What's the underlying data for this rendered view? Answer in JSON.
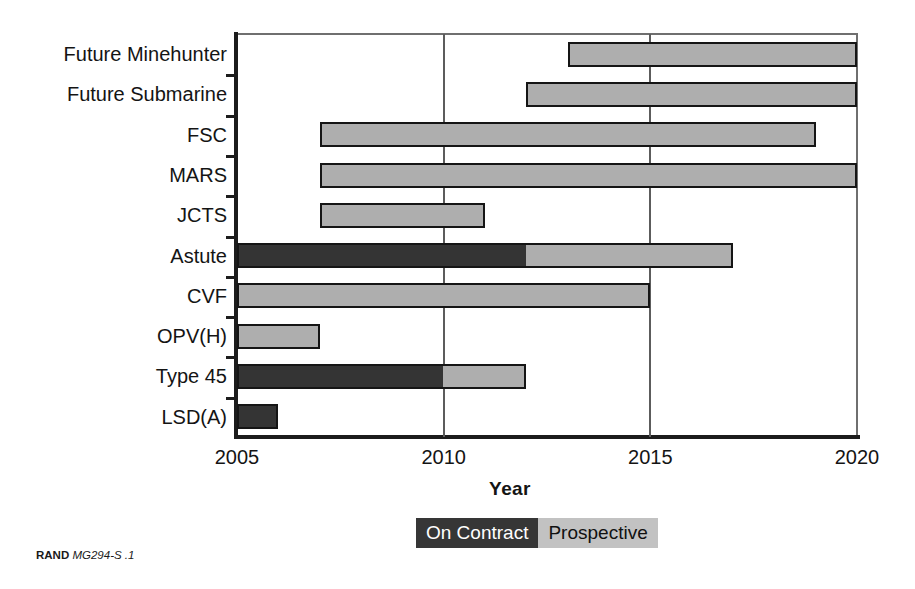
{
  "chart_data": {
    "type": "bar",
    "title": "",
    "subtitle": "",
    "xlabel": "Year",
    "ylabel": "",
    "xlim": [
      2005,
      2020
    ],
    "xticks": [
      2005,
      2010,
      2015,
      2020
    ],
    "xtick_labels": [
      "2005",
      "2010",
      "2015",
      "2020"
    ],
    "grid": "vertical gridlines at 2010 and 2015",
    "legend_position": "bottom-center",
    "orientation": "horizontal-gantt",
    "categories": [
      "Future Minehunter",
      "Future Submarine",
      "FSC",
      "MARS",
      "JCTS",
      "Astute",
      "CVF",
      "OPV(H)",
      "Type 45",
      "LSD(A)"
    ],
    "series": [
      {
        "name": "On Contract",
        "color": "#343434",
        "values": [
          null,
          null,
          null,
          null,
          null,
          {
            "start": 2005,
            "end": 2012
          },
          null,
          null,
          {
            "start": 2005,
            "end": 2010
          },
          {
            "start": 2005,
            "end": 2006
          }
        ]
      },
      {
        "name": "Prospective",
        "color": "#aeaeae",
        "values": [
          {
            "start": 2013,
            "end": 2020
          },
          {
            "start": 2012,
            "end": 2020
          },
          {
            "start": 2007,
            "end": 2019
          },
          {
            "start": 2007,
            "end": 2020
          },
          {
            "start": 2007,
            "end": 2011
          },
          {
            "start": 2012,
            "end": 2017
          },
          {
            "start": 2005,
            "end": 2015
          },
          {
            "start": 2005,
            "end": 2007
          },
          {
            "start": 2010,
            "end": 2012
          },
          null
        ]
      }
    ],
    "bars": [
      {
        "category": "Future Minehunter",
        "segments": [
          {
            "type": "Prospective",
            "start": 2013,
            "end": 2020
          }
        ]
      },
      {
        "category": "Future Submarine",
        "segments": [
          {
            "type": "Prospective",
            "start": 2012,
            "end": 2020
          }
        ]
      },
      {
        "category": "FSC",
        "segments": [
          {
            "type": "Prospective",
            "start": 2007,
            "end": 2019
          }
        ]
      },
      {
        "category": "MARS",
        "segments": [
          {
            "type": "Prospective",
            "start": 2007,
            "end": 2020
          }
        ]
      },
      {
        "category": "JCTS",
        "segments": [
          {
            "type": "Prospective",
            "start": 2007,
            "end": 2011
          }
        ]
      },
      {
        "category": "Astute",
        "segments": [
          {
            "type": "On Contract",
            "start": 2005,
            "end": 2012
          },
          {
            "type": "Prospective",
            "start": 2012,
            "end": 2017
          }
        ]
      },
      {
        "category": "CVF",
        "segments": [
          {
            "type": "Prospective",
            "start": 2005,
            "end": 2015
          }
        ]
      },
      {
        "category": "OPV(H)",
        "segments": [
          {
            "type": "Prospective",
            "start": 2005,
            "end": 2007
          }
        ]
      },
      {
        "category": "Type 45",
        "segments": [
          {
            "type": "On Contract",
            "start": 2005,
            "end": 2010
          },
          {
            "type": "Prospective",
            "start": 2010,
            "end": 2012
          }
        ]
      },
      {
        "category": "LSD(A)",
        "segments": [
          {
            "type": "On Contract",
            "start": 2005,
            "end": 2006
          }
        ]
      }
    ]
  },
  "legend": {
    "items": [
      {
        "label": "On Contract",
        "color": "#363636",
        "text_color": "#ffffff"
      },
      {
        "label": "Prospective",
        "color": "#c2c2c2",
        "text_color": "#111111"
      }
    ]
  },
  "axis": {
    "x_title": "Year"
  },
  "source": {
    "org": "RAND",
    "ref": "MG294-S .1"
  }
}
